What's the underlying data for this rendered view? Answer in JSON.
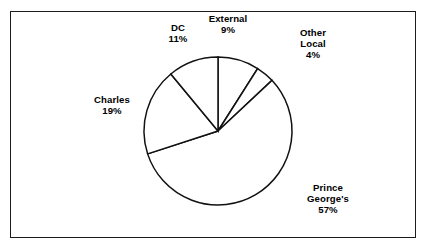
{
  "chart_data": {
    "type": "pie",
    "title": "",
    "subtitle": "",
    "xlabel": "",
    "ylabel": "",
    "grid": false,
    "legend_position": "none",
    "label_format": "name above percent",
    "start_angle_deg": 0,
    "direction": "clockwise",
    "categories": [
      "External",
      "Other Local",
      "Prince George's",
      "Charles",
      "DC"
    ],
    "values": [
      9,
      4,
      57,
      19,
      11
    ],
    "value_unit": "%",
    "slices": [
      {
        "name": "External",
        "value": 9,
        "value_label": "9%",
        "label_lines": [
          "External",
          "9%"
        ],
        "start_deg": 0,
        "end_deg": 32.4,
        "fill": "#ffffff",
        "stroke": "#111111"
      },
      {
        "name": "Other Local",
        "value": 4,
        "value_label": "4%",
        "label_lines": [
          "Other",
          "Local",
          "4%"
        ],
        "start_deg": 32.4,
        "end_deg": 46.8,
        "fill": "#ffffff",
        "stroke": "#111111"
      },
      {
        "name": "Prince George's",
        "value": 57,
        "value_label": "57%",
        "label_lines": [
          "Prince",
          "George's",
          "57%"
        ],
        "start_deg": 46.8,
        "end_deg": 252.0,
        "fill": "#ffffff",
        "stroke": "#111111"
      },
      {
        "name": "Charles",
        "value": 19,
        "value_label": "19%",
        "label_lines": [
          "Charles",
          "19%"
        ],
        "start_deg": 252.0,
        "end_deg": 320.4,
        "fill": "#ffffff",
        "stroke": "#111111"
      },
      {
        "name": "DC",
        "value": 11,
        "value_label": "11%",
        "label_lines": [
          "DC",
          "11%"
        ],
        "start_deg": 320.4,
        "end_deg": 360.0,
        "fill": "#ffffff",
        "stroke": "#111111"
      }
    ]
  },
  "labels": {
    "dc": {
      "name": "DC",
      "value": "11%"
    },
    "external": {
      "name": "External",
      "value": "9%"
    },
    "other_local": {
      "name": "Other",
      "name2": "Local",
      "value": "4%"
    },
    "charles": {
      "name": "Charles",
      "value": "19%"
    },
    "prince": {
      "name": "Prince",
      "name2": "George's",
      "value": "57%"
    }
  },
  "colors": {
    "slice_fill": "#ffffff",
    "slice_stroke": "#111111",
    "frame_border": "#1c1c1c",
    "label_text": "#000000",
    "background": "#ffffff"
  }
}
